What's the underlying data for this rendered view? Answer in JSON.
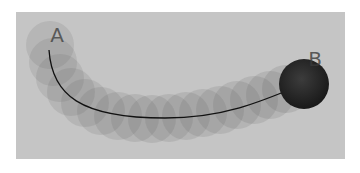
{
  "diagram": {
    "type": "motion-trail",
    "start_label": "A",
    "end_label": "B",
    "colors": {
      "page_background": "#ffffff",
      "panel_background": "#c5c5c5",
      "trail_circle": "#5a5a5a",
      "path_line": "#111111",
      "end_ball": "#2a2a2a",
      "label_text": "#3a3a3a"
    },
    "panel": {
      "x": 16,
      "y": 12,
      "width": 329,
      "height": 147
    },
    "path": "M49,50 C52,95 80,118 165,118 C225,118 265,100 303,84",
    "trail_circles": [
      {
        "cx": 50,
        "cy": 45,
        "r": 24
      },
      {
        "cx": 53,
        "cy": 62,
        "r": 24
      },
      {
        "cx": 60,
        "cy": 78,
        "r": 24
      },
      {
        "cx": 71,
        "cy": 92,
        "r": 24
      },
      {
        "cx": 85,
        "cy": 103,
        "r": 24
      },
      {
        "cx": 101,
        "cy": 111,
        "r": 24
      },
      {
        "cx": 118,
        "cy": 116,
        "r": 24
      },
      {
        "cx": 135,
        "cy": 118,
        "r": 24
      },
      {
        "cx": 152,
        "cy": 119,
        "r": 24
      },
      {
        "cx": 169,
        "cy": 118,
        "r": 24
      },
      {
        "cx": 186,
        "cy": 116,
        "r": 24
      },
      {
        "cx": 203,
        "cy": 113,
        "r": 24
      },
      {
        "cx": 220,
        "cy": 110,
        "r": 24
      },
      {
        "cx": 237,
        "cy": 105,
        "r": 24
      },
      {
        "cx": 254,
        "cy": 100,
        "r": 24
      },
      {
        "cx": 270,
        "cy": 95,
        "r": 24
      },
      {
        "cx": 286,
        "cy": 89,
        "r": 24
      }
    ],
    "end_ball": {
      "cx": 304,
      "cy": 84,
      "r": 25
    },
    "start_label_pos": {
      "x": 57,
      "y": 42
    },
    "end_label_pos": {
      "x": 315,
      "y": 66
    }
  }
}
